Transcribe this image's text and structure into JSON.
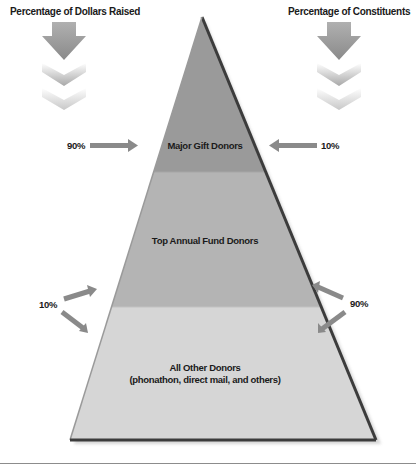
{
  "diagram": {
    "type": "pyramid",
    "left_header": "Percentage of Dollars Raised",
    "right_header": "Percentage of Constituents",
    "tiers": [
      {
        "label": "Major Gift Donors",
        "dollars_pct": "90%",
        "constituents_pct": "10%",
        "color": "#9a9a9a"
      },
      {
        "label": "Top Annual Fund Donors",
        "dollars_pct": "10%",
        "constituents_pct": "90%",
        "color": "#b4b4b4"
      },
      {
        "label": "All Other Donors",
        "sublabel": "(phonathon, direct mail, and others)",
        "color": "#d6d6d6"
      }
    ],
    "colors": {
      "arrow": "#8a8a8a",
      "pyramid_edge": "#3c3c3c",
      "text": "#1a1a1a"
    }
  }
}
